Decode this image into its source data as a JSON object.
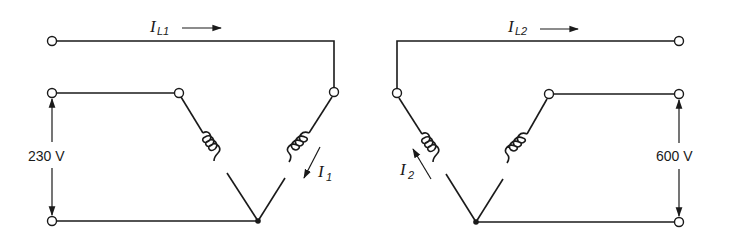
{
  "diagram": {
    "primary": {
      "line_current_symbol": "I",
      "line_current_subscript": "L1",
      "phase_current_symbol": "I",
      "phase_current_subscript": "1",
      "voltage_label": "230 V"
    },
    "secondary": {
      "line_current_symbol": "I",
      "line_current_subscript": "L2",
      "phase_current_symbol": "I",
      "phase_current_subscript": "2",
      "voltage_label": "600 V"
    },
    "colors": {
      "ink": "#1a1a1a",
      "background": "#ffffff"
    }
  }
}
